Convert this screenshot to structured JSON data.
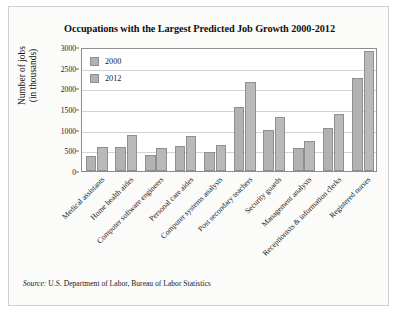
{
  "chart_data": {
    "type": "bar",
    "title": "Occupations with the Largest Predicted Job Growth 2000-2012",
    "xlabel": "",
    "ylabel": "Number of jobs (in thousands)",
    "ylabel_line1": "Number of jobs",
    "ylabel_line2": "(in thousands)",
    "ylim": [
      0,
      3000
    ],
    "ytick_step": 500,
    "yticks": [
      "3000",
      "2500",
      "2000",
      "1500",
      "1000",
      "500",
      "0"
    ],
    "ytick_values": [
      3000,
      2500,
      2000,
      1500,
      1000,
      500,
      0
    ],
    "grid": true,
    "legend_position": "top-left",
    "categories": [
      "Medical assistants",
      "Home health aides",
      "Computer software engineers",
      "Personal care aides",
      "Computer systems analysts",
      "Post secondary teachers",
      "Security guards",
      "Management analysts",
      "Receptionists & information clerks",
      "Registered nurses"
    ],
    "series": [
      {
        "name": "2000",
        "color": "#b2b2b2",
        "values": [
          360,
          580,
          390,
          600,
          470,
          1550,
          1000,
          550,
          1050,
          2250
        ]
      },
      {
        "name": "2012",
        "color": "#b9b9b9",
        "values": [
          580,
          860,
          560,
          840,
          630,
          2150,
          1300,
          720,
          1380,
          2900
        ]
      }
    ]
  },
  "source": {
    "prefix": "Source:",
    "text": "U.S. Department of Labor, Bureau of Labor Statistics"
  }
}
